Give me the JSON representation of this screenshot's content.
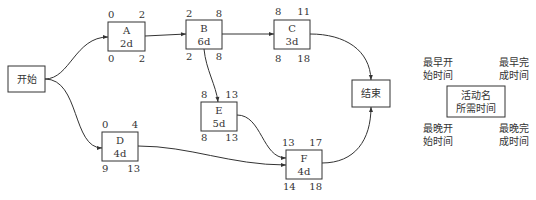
{
  "diagram": {
    "type": "activity-on-node network",
    "start": {
      "id": "start",
      "label": "开始"
    },
    "end": {
      "id": "end",
      "label": "结束"
    },
    "activities": [
      {
        "id": "A",
        "name": "A",
        "duration": "2d",
        "es": "0",
        "ef": "2",
        "ls": "0",
        "lf": "2"
      },
      {
        "id": "B",
        "name": "B",
        "duration": "6d",
        "es": "2",
        "ef": "8",
        "ls": "2",
        "lf": "8"
      },
      {
        "id": "C",
        "name": "C",
        "duration": "3d",
        "es": "8",
        "ef": "11",
        "ls": "8",
        "lf": "18"
      },
      {
        "id": "D",
        "name": "D",
        "duration": "4d",
        "es": "0",
        "ef": "4",
        "ls": "9",
        "lf": "13"
      },
      {
        "id": "E",
        "name": "E",
        "duration": "5d",
        "es": "8",
        "ef": "13",
        "ls": "8",
        "lf": "13"
      },
      {
        "id": "F",
        "name": "F",
        "duration": "4d",
        "es": "13",
        "ef": "17",
        "ls": "14",
        "lf": "18"
      }
    ],
    "edges": [
      {
        "from": "start",
        "to": "A"
      },
      {
        "from": "start",
        "to": "D"
      },
      {
        "from": "A",
        "to": "B"
      },
      {
        "from": "B",
        "to": "C"
      },
      {
        "from": "B",
        "to": "E"
      },
      {
        "from": "C",
        "to": "end"
      },
      {
        "from": "D",
        "to": "F"
      },
      {
        "from": "E",
        "to": "F"
      },
      {
        "from": "F",
        "to": "end"
      }
    ],
    "legend": {
      "es_label_line1": "最早开",
      "es_label_line2": "始时间",
      "ef_label_line1": "最早完",
      "ef_label_line2": "成时间",
      "ls_label_line1": "最晚开",
      "ls_label_line2": "始时间",
      "lf_label_line1": "最晚完",
      "lf_label_line2": "成时间",
      "box_line1": "活动名",
      "box_line2": "所需时间"
    }
  }
}
